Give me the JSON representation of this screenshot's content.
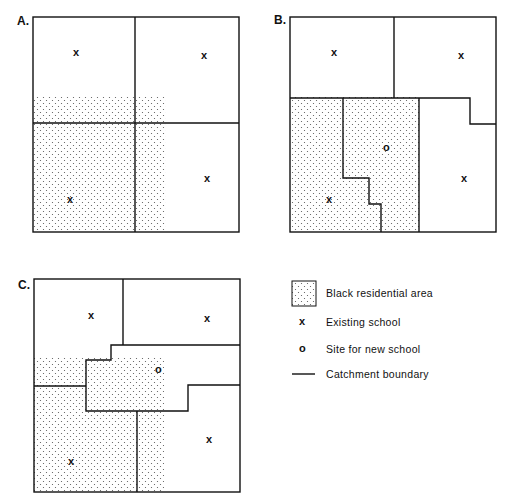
{
  "panels": [
    {
      "id": "A",
      "label": "A."
    },
    {
      "id": "B",
      "label": "B."
    },
    {
      "id": "C",
      "label": "C."
    }
  ],
  "symbols": {
    "existing": "x",
    "new": "o"
  },
  "legend": {
    "items": [
      {
        "symbol": "dotted-box",
        "label": "Black residential area"
      },
      {
        "symbol": "x",
        "label": "Existing school"
      },
      {
        "symbol": "o",
        "label": "Site for new school"
      },
      {
        "symbol": "line",
        "label": "Catchment boundary"
      }
    ]
  },
  "colors": {
    "line": "#111111",
    "dots": "#555555",
    "background": "#ffffff"
  }
}
